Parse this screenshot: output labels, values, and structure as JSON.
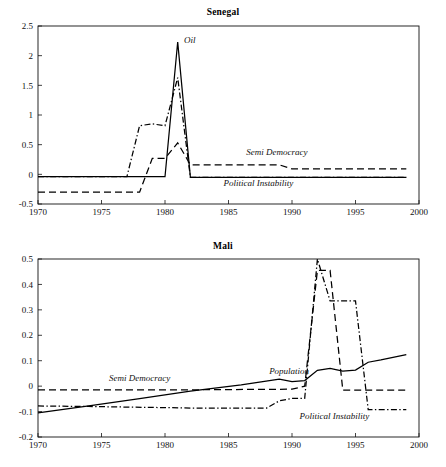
{
  "figure": {
    "background": "#ffffff",
    "ink": "#000000",
    "panels": [
      "Senegal",
      "Mali"
    ]
  },
  "chart_data": [
    {
      "type": "line",
      "title": "Senegal",
      "xlabel": "",
      "ylabel": "",
      "xlim": [
        1970,
        2000
      ],
      "ylim": [
        -0.5,
        2.5
      ],
      "xticks": [
        1970,
        1975,
        1980,
        1985,
        1990,
        1995,
        2000
      ],
      "xticklabels": [
        "1970",
        "1975",
        "1980",
        "1985",
        "1990",
        "1995",
        "2000"
      ],
      "yticks": [
        -0.5,
        0,
        0.5,
        1,
        1.5,
        2,
        2.5
      ],
      "yticklabels": [
        "-0.5",
        "0",
        "0.5",
        "1",
        "1.5",
        "2",
        "2.5"
      ],
      "grid": false,
      "legend": "inline-annotations",
      "annotations": [
        {
          "text": "Oil",
          "x": 1981.5,
          "y": 2.22,
          "series": "Oil"
        },
        {
          "text": "Semi Democracy",
          "x": 1986.4,
          "y": 0.33,
          "series": "Semi Democracy"
        },
        {
          "text": "Political Instability",
          "x": 1984.6,
          "y": -0.19,
          "series": "Political Instability"
        }
      ],
      "series": [
        {
          "name": "Oil",
          "style": "solid",
          "x": [
            1970,
            1977,
            1978,
            1979,
            1980,
            1981,
            1982,
            1983,
            1989,
            1990,
            1999
          ],
          "values": [
            -0.04,
            -0.04,
            -0.04,
            -0.04,
            -0.04,
            2.23,
            -0.05,
            -0.05,
            -0.05,
            -0.05,
            -0.05
          ]
        },
        {
          "name": "Semi Democracy",
          "style": "dashed",
          "x": [
            1970,
            1977,
            1978,
            1979,
            1980,
            1981,
            1982,
            1983,
            1989,
            1990,
            1999
          ],
          "values": [
            -0.3,
            -0.3,
            -0.3,
            0.27,
            0.27,
            0.53,
            0.16,
            0.16,
            0.16,
            0.09,
            0.09
          ]
        },
        {
          "name": "Political Instability",
          "style": "dashdot",
          "x": [
            1970,
            1977,
            1978,
            1979,
            1980,
            1981,
            1982,
            1983,
            1989,
            1990,
            1999
          ],
          "values": [
            -0.04,
            -0.04,
            0.82,
            0.85,
            0.82,
            1.63,
            -0.05,
            -0.05,
            -0.05,
            -0.05,
            -0.05
          ]
        }
      ]
    },
    {
      "type": "line",
      "title": "Mali",
      "xlabel": "",
      "ylabel": "",
      "xlim": [
        1970,
        2000
      ],
      "ylim": [
        -0.2,
        0.5
      ],
      "xticks": [
        1970,
        1975,
        1980,
        1985,
        1990,
        1995,
        2000
      ],
      "xticklabels": [
        "1970",
        "1975",
        "1980",
        "1985",
        "1990",
        "1995",
        "2000"
      ],
      "yticks": [
        -0.2,
        -0.1,
        0,
        0.1,
        0.2,
        0.3,
        0.4,
        0.5
      ],
      "yticklabels": [
        "-0.2",
        "-0.1",
        "0",
        "0.1",
        "0.2",
        "0.3",
        "0.4",
        "0.5"
      ],
      "grid": false,
      "legend": "inline-annotations",
      "annotations": [
        {
          "text": "Semi Democracy",
          "x": 1975.6,
          "y": 0.022,
          "series": "Semi Democracy"
        },
        {
          "text": "Population",
          "x": 1988.2,
          "y": 0.048,
          "series": "Population"
        },
        {
          "text": "Political Instability",
          "x": 1990.6,
          "y": -0.128,
          "series": "Political Instability"
        }
      ],
      "series": [
        {
          "name": "Population",
          "style": "solid",
          "x": [
            1970,
            1974,
            1978,
            1982,
            1986,
            1989,
            1990,
            1991,
            1992,
            1993,
            1994,
            1995,
            1996,
            1997,
            1999
          ],
          "values": [
            -0.105,
            -0.078,
            -0.049,
            -0.02,
            0.005,
            0.028,
            0.018,
            0.022,
            0.062,
            0.07,
            0.059,
            0.063,
            0.094,
            0.103,
            0.124
          ]
        },
        {
          "name": "Semi Democracy",
          "style": "dashed",
          "x": [
            1970,
            1980,
            1990,
            1991,
            1992,
            1993,
            1994,
            1999
          ],
          "values": [
            -0.015,
            -0.015,
            -0.012,
            0.0,
            0.455,
            0.455,
            -0.016,
            -0.016
          ]
        },
        {
          "name": "Political Instability",
          "style": "dashdot",
          "x": [
            1970,
            1974,
            1982,
            1988,
            1989,
            1990,
            1991,
            1992,
            1993,
            1995,
            1996,
            1999
          ],
          "values": [
            -0.078,
            -0.08,
            -0.086,
            -0.086,
            -0.058,
            -0.048,
            -0.048,
            0.5,
            0.335,
            0.335,
            -0.092,
            -0.092
          ]
        }
      ]
    }
  ]
}
